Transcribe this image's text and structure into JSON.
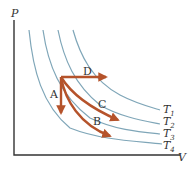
{
  "diagram": {
    "type": "pv-diagram",
    "axes": {
      "y_label": "P",
      "x_label": "V"
    },
    "isotherms": [
      {
        "label": "T",
        "subscript": "1"
      },
      {
        "label": "T",
        "subscript": "2"
      },
      {
        "label": "T",
        "subscript": "3"
      },
      {
        "label": "T",
        "subscript": "4"
      }
    ],
    "processes": [
      {
        "label": "A",
        "description": "isochoric (constant volume) pressure drop to T4"
      },
      {
        "label": "B",
        "description": "curved path to T4"
      },
      {
        "label": "C",
        "description": "curved path to T3"
      },
      {
        "label": "D",
        "description": "isobaric (constant pressure) expansion to T1"
      }
    ],
    "colors": {
      "isotherm": "#7fa6b8",
      "process_arrow": "#b5532b",
      "axis": "#333333"
    }
  }
}
